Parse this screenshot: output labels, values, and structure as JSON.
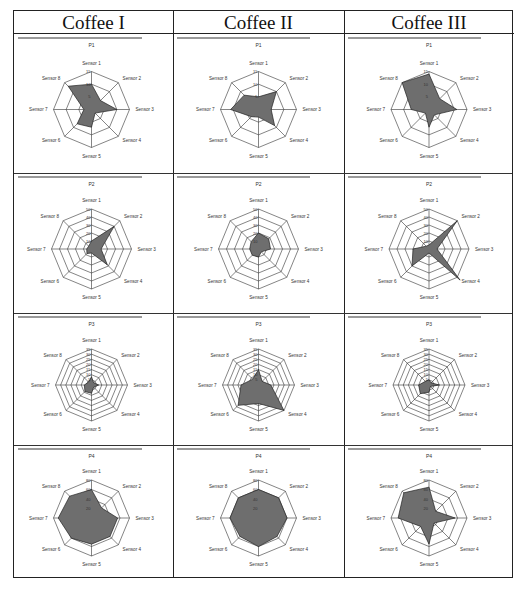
{
  "columns": [
    "Coffee I",
    "Coffee II",
    "Coffee III"
  ],
  "chart_data": [
    {
      "type": "radar",
      "title": "P1",
      "column": "Coffee I",
      "categories": [
        "Sensor 1",
        "Sensor 2",
        "Sensor 3",
        "Sensor 4",
        "Sensor 5",
        "Sensor 6",
        "Sensor 7",
        "Sensor 8"
      ],
      "values": [
        10,
        5,
        10,
        2,
        7,
        8,
        3,
        13
      ],
      "rmax": 15,
      "ticks": [
        0,
        5,
        10,
        15
      ]
    },
    {
      "type": "radar",
      "title": "P1",
      "column": "Coffee II",
      "categories": [
        "Sensor 1",
        "Sensor 2",
        "Sensor 3",
        "Sensor 4",
        "Sensor 5",
        "Sensor 6",
        "Sensor 7",
        "Sensor 8"
      ],
      "values": [
        5,
        10,
        5,
        9,
        3,
        4,
        11,
        8
      ],
      "rmax": 15,
      "ticks": [
        0,
        5,
        10,
        15
      ]
    },
    {
      "type": "radar",
      "title": "P1",
      "column": "Coffee III",
      "categories": [
        "Sensor 1",
        "Sensor 2",
        "Sensor 3",
        "Sensor 4",
        "Sensor 5",
        "Sensor 6",
        "Sensor 7",
        "Sensor 8"
      ],
      "values": [
        14,
        6,
        11,
        3,
        7,
        2,
        7,
        15
      ],
      "rmax": 15,
      "ticks": [
        0,
        5,
        10,
        15
      ]
    },
    {
      "type": "radar",
      "title": "P2",
      "column": "Coffee I",
      "categories": [
        "Sensor 1",
        "Sensor 2",
        "Sensor 3",
        "Sensor 4",
        "Sensor 5",
        "Sensor 6",
        "Sensor 7",
        "Sensor 8"
      ],
      "values": [
        10,
        40,
        12,
        28,
        5,
        8,
        6,
        5
      ],
      "rmax": 50,
      "ticks": [
        0,
        10,
        20,
        30,
        40,
        50
      ]
    },
    {
      "type": "radar",
      "title": "P2",
      "column": "Coffee II",
      "categories": [
        "Sensor 1",
        "Sensor 2",
        "Sensor 3",
        "Sensor 4",
        "Sensor 5",
        "Sensor 6",
        "Sensor 7",
        "Sensor 8"
      ],
      "values": [
        20,
        18,
        15,
        5,
        10,
        11,
        11,
        13
      ],
      "rmax": 50,
      "ticks": [
        0,
        10,
        20,
        30,
        40,
        50
      ]
    },
    {
      "type": "radar",
      "title": "P2",
      "column": "Coffee III",
      "categories": [
        "Sensor 1",
        "Sensor 2",
        "Sensor 3",
        "Sensor 4",
        "Sensor 5",
        "Sensor 6",
        "Sensor 7",
        "Sensor 8"
      ],
      "values": [
        5,
        50,
        10,
        55,
        5,
        30,
        20,
        5
      ],
      "rmax": 50,
      "ticks": [
        0,
        10,
        20,
        30,
        40,
        50
      ]
    },
    {
      "type": "radar",
      "title": "P3",
      "column": "Coffee I",
      "categories": [
        "Sensor 1",
        "Sensor 2",
        "Sensor 3",
        "Sensor 4",
        "Sensor 5",
        "Sensor 6",
        "Sensor 7",
        "Sensor 8"
      ],
      "values": [
        8,
        3,
        7,
        3,
        8,
        9,
        7,
        4
      ],
      "rmax": 35,
      "ticks": [
        0,
        5,
        10,
        15,
        20,
        25,
        30,
        35
      ]
    },
    {
      "type": "radar",
      "title": "P3",
      "column": "Coffee II",
      "categories": [
        "Sensor 1",
        "Sensor 2",
        "Sensor 3",
        "Sensor 4",
        "Sensor 5",
        "Sensor 6",
        "Sensor 7",
        "Sensor 8"
      ],
      "values": [
        15,
        5,
        12,
        35,
        18,
        28,
        17,
        8
      ],
      "rmax": 35,
      "ticks": [
        0,
        5,
        10,
        15,
        20,
        25,
        30,
        35
      ]
    },
    {
      "type": "radar",
      "title": "P3",
      "column": "Coffee III",
      "categories": [
        "Sensor 1",
        "Sensor 2",
        "Sensor 3",
        "Sensor 4",
        "Sensor 5",
        "Sensor 6",
        "Sensor 7",
        "Sensor 8"
      ],
      "values": [
        5,
        3,
        10,
        2,
        7,
        12,
        10,
        5
      ],
      "rmax": 35,
      "ticks": [
        0,
        5,
        10,
        15,
        20,
        25,
        30,
        35
      ]
    },
    {
      "type": "radar",
      "title": "P4",
      "column": "Coffee I",
      "categories": [
        "Sensor 1",
        "Sensor 2",
        "Sensor 3",
        "Sensor 4",
        "Sensor 5",
        "Sensor 6",
        "Sensor 7",
        "Sensor 8"
      ],
      "values": [
        60,
        30,
        55,
        55,
        55,
        60,
        70,
        65
      ],
      "rmax": 80,
      "ticks": [
        0,
        20,
        40,
        60,
        80
      ]
    },
    {
      "type": "radar",
      "title": "P4",
      "column": "Coffee II",
      "categories": [
        "Sensor 1",
        "Sensor 2",
        "Sensor 3",
        "Sensor 4",
        "Sensor 5",
        "Sensor 6",
        "Sensor 7",
        "Sensor 8"
      ],
      "values": [
        60,
        60,
        60,
        55,
        60,
        55,
        60,
        60
      ],
      "rmax": 80,
      "ticks": [
        0,
        20,
        40,
        60,
        80
      ]
    },
    {
      "type": "radar",
      "title": "P4",
      "column": "Coffee III",
      "categories": [
        "Sensor 1",
        "Sensor 2",
        "Sensor 3",
        "Sensor 4",
        "Sensor 5",
        "Sensor 6",
        "Sensor 7",
        "Sensor 8"
      ],
      "values": [
        65,
        20,
        55,
        15,
        55,
        25,
        65,
        75
      ],
      "rmax": 80,
      "ticks": [
        0,
        20,
        40,
        60,
        80
      ]
    }
  ],
  "colors": {
    "fill": "#6e6e6e",
    "grid": "#333333",
    "border": "#222222",
    "topbar": "#9a9a9a"
  }
}
